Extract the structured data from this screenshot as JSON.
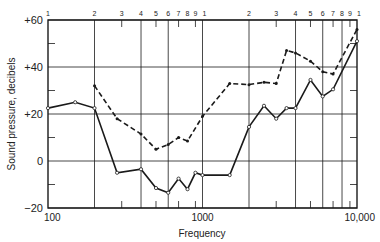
{
  "chart_data": {
    "type": "line",
    "title": "",
    "xlabel": "Frequency",
    "ylabel": "Sound pressure, decibels",
    "xscale": "log",
    "xlim": [
      100,
      10000
    ],
    "ylim": [
      -20,
      60
    ],
    "grid": true,
    "legend": null,
    "x_tick_labels": [
      "100",
      "1000",
      "10,000"
    ],
    "x_tick_values": [
      100,
      1000,
      10000
    ],
    "top_axis_labels": [
      "1",
      "2",
      "3",
      "4",
      "5",
      "6",
      "7",
      "8",
      "9",
      "1",
      "2",
      "3",
      "4",
      "5",
      "6",
      "7",
      "8",
      "9",
      "1"
    ],
    "top_axis_values": [
      100,
      200,
      300,
      400,
      500,
      600,
      700,
      800,
      900,
      1000,
      2000,
      3000,
      4000,
      5000,
      6000,
      7000,
      8000,
      9000,
      10000
    ],
    "major_vertical_gridlines": [
      200,
      400,
      600,
      1000,
      2000,
      4000,
      6000,
      8000
    ],
    "minor_vertical_ticks": [
      300,
      500,
      700,
      900,
      3000,
      5000,
      7000,
      9000
    ],
    "y_tick_labels": [
      "+60",
      "+40",
      "+20",
      "0",
      "−20"
    ],
    "y_tick_values": [
      60,
      40,
      20,
      0,
      -20
    ],
    "y_minor_ticks": [
      50,
      30,
      10,
      -10
    ],
    "series": [
      {
        "name": "solid curve",
        "style": "solid",
        "marker": "open-circle",
        "color": "#1a1a1a",
        "x": [
          100,
          150,
          200,
          280,
          400,
          500,
          600,
          700,
          800,
          900,
          1000,
          1500,
          2000,
          2500,
          3000,
          3500,
          4000,
          5000,
          6000,
          7000,
          10000
        ],
        "y": [
          22.5,
          25,
          22.5,
          -5,
          -3.5,
          -11.5,
          -13.5,
          -7.5,
          -12,
          -5,
          -6,
          -6,
          14.5,
          23.5,
          18,
          22.5,
          22.5,
          34.5,
          27.5,
          30.5,
          51
        ]
      },
      {
        "name": "dashed curve",
        "style": "dashed",
        "marker": "filled-dot",
        "color": "#1a1a1a",
        "x": [
          200,
          280,
          400,
          500,
          600,
          700,
          800,
          1000,
          1500,
          2000,
          2500,
          3000,
          3500,
          4000,
          5000,
          6000,
          7000,
          10000
        ],
        "y": [
          32,
          18,
          11.5,
          5,
          7,
          10,
          8.5,
          19,
          33,
          32.5,
          33.5,
          33,
          47,
          46,
          42.5,
          38,
          37,
          56
        ]
      }
    ]
  }
}
